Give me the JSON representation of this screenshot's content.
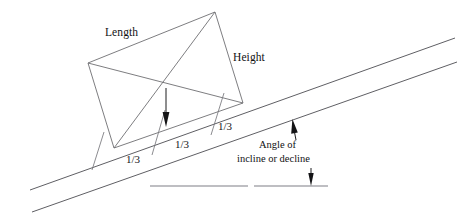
{
  "diagram": {
    "background_color": "#ffffff",
    "line_color": "#6e6e72",
    "ground_color": "#a9a9ae",
    "arrow_color": "#141416",
    "labels": {
      "length": "Length",
      "height": "Height",
      "angle_line1": "Angle of",
      "angle_line2": "incline or decline"
    },
    "segments": {
      "third_1": "1/3",
      "third_2": "1/3",
      "third_3": "1/3"
    },
    "geometry": {
      "quad_vertices": [
        {
          "name": "left-vertex",
          "x": 88,
          "y": 63
        },
        {
          "name": "apex-vertex",
          "x": 215,
          "y": 12
        },
        {
          "name": "right-vertex",
          "x": 243,
          "y": 103
        },
        {
          "name": "bottom-left-vertex",
          "x": 114,
          "y": 148
        }
      ],
      "center_vertex": {
        "x": 166,
        "y": 88
      },
      "incline_upper": {
        "x1": 30,
        "y1": 190,
        "x2": 455,
        "y2": 38
      },
      "incline_lower": {
        "x1": 32,
        "y1": 212,
        "x2": 457,
        "y2": 62
      },
      "ground_left": {
        "x1": 150,
        "y1": 186,
        "x2": 248,
        "y2": 186
      },
      "ground_right": {
        "x1": 254,
        "y1": 186,
        "x2": 328,
        "y2": 186
      },
      "tick_marks": [
        {
          "x1": 92,
          "y1": 170,
          "x2": 104,
          "y2": 132
        },
        {
          "x1": 152,
          "y1": 155,
          "x2": 165,
          "y2": 110
        },
        {
          "x1": 211,
          "y1": 135,
          "x2": 224,
          "y2": 93
        }
      ],
      "arrows": [
        {
          "name": "height-drop-arrow",
          "x1": 166,
          "y1": 88,
          "x2": 166,
          "y2": 125,
          "direction": "down"
        },
        {
          "name": "angle-pointer-arrow",
          "x1": 296,
          "y1": 139,
          "x2": 293,
          "y2": 120,
          "direction": "up"
        },
        {
          "name": "ground-pointer-arrow",
          "x1": 311,
          "y1": 168,
          "x2": 311,
          "y2": 186,
          "direction": "down"
        }
      ]
    }
  }
}
